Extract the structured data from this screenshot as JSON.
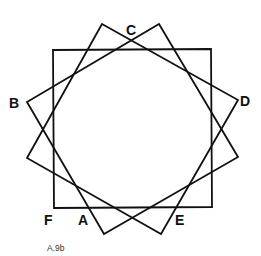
{
  "figure": {
    "caption": "A.9b",
    "shapes": [
      {
        "name": "axis-aligned-square",
        "rotation_deg": 0
      },
      {
        "name": "rotated-square-1",
        "rotation_deg": 30
      },
      {
        "name": "rotated-square-2",
        "rotation_deg": -30
      }
    ],
    "labels": {
      "A": "A",
      "B": "B",
      "C": "C",
      "D": "D",
      "E": "E",
      "F": "F"
    },
    "stroke_color": "#111111",
    "background_color": "#ffffff"
  }
}
